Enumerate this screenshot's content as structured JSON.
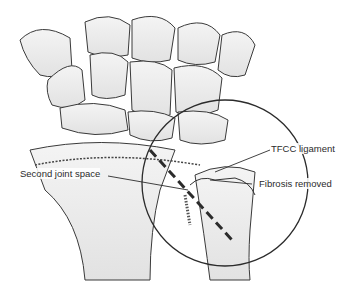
{
  "figure": {
    "labels": {
      "tfcc": "TFCC ligament",
      "fibrosis": "Fibrosis removed",
      "joint": "Second joint space"
    },
    "colors": {
      "ink": "#2b2b2b",
      "shade": "#cfcfcf",
      "background": "#ffffff"
    }
  }
}
